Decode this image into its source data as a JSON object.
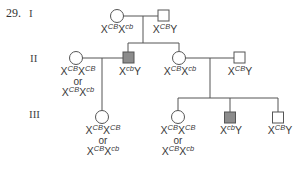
{
  "question_number": "29.",
  "generations": [
    "I",
    "II",
    "III"
  ],
  "colors": {
    "line": "#555555",
    "affected_fill": "#8c8c8c",
    "unaffected_fill": "#ffffff"
  },
  "or_text": "or",
  "individuals": [
    {
      "id": "I-1",
      "generation": "I",
      "sex": "female",
      "affected": false,
      "genotypes": [
        {
          "base": "X",
          "sup": "CB",
          "base2": "X",
          "sup2": "cb"
        }
      ]
    },
    {
      "id": "I-2",
      "generation": "I",
      "sex": "male",
      "affected": false,
      "genotypes": [
        {
          "base": "X",
          "sup": "CB",
          "base2": "Y",
          "sup2": ""
        }
      ]
    },
    {
      "id": "II-1",
      "generation": "II",
      "sex": "female",
      "affected": false,
      "genotypes": [
        {
          "base": "X",
          "sup": "CB",
          "base2": "X",
          "sup2": "CB"
        },
        {
          "base": "X",
          "sup": "CB",
          "base2": "X",
          "sup2": "cb"
        }
      ]
    },
    {
      "id": "II-2",
      "generation": "II",
      "sex": "male",
      "affected": true,
      "genotypes": [
        {
          "base": "X",
          "sup": "cb",
          "base2": "Y",
          "sup2": ""
        }
      ]
    },
    {
      "id": "II-3",
      "generation": "II",
      "sex": "female",
      "affected": false,
      "genotypes": [
        {
          "base": "X",
          "sup": "CB",
          "base2": "X",
          "sup2": "cb"
        }
      ]
    },
    {
      "id": "II-4",
      "generation": "II",
      "sex": "male",
      "affected": false,
      "genotypes": [
        {
          "base": "X",
          "sup": "CB",
          "base2": "Y",
          "sup2": ""
        }
      ]
    },
    {
      "id": "III-1",
      "generation": "III",
      "sex": "female",
      "affected": false,
      "genotypes": [
        {
          "base": "X",
          "sup": "CB",
          "base2": "X",
          "sup2": "CB"
        },
        {
          "base": "X",
          "sup": "CB",
          "base2": "X",
          "sup2": "cb"
        }
      ]
    },
    {
      "id": "III-2",
      "generation": "III",
      "sex": "female",
      "affected": false,
      "genotypes": [
        {
          "base": "X",
          "sup": "CB",
          "base2": "X",
          "sup2": "CB"
        },
        {
          "base": "X",
          "sup": "CB",
          "base2": "X",
          "sup2": "cb"
        }
      ]
    },
    {
      "id": "III-3",
      "generation": "III",
      "sex": "male",
      "affected": true,
      "genotypes": [
        {
          "base": "X",
          "sup": "cb",
          "base2": "Y",
          "sup2": ""
        }
      ]
    },
    {
      "id": "III-4",
      "generation": "III",
      "sex": "male",
      "affected": false,
      "genotypes": [
        {
          "base": "X",
          "sup": "CB",
          "base2": "Y",
          "sup2": ""
        }
      ]
    }
  ]
}
